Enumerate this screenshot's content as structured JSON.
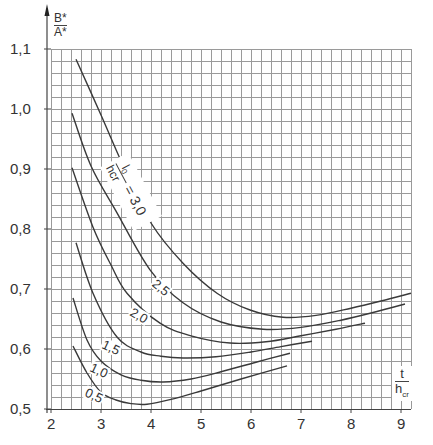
{
  "chart_data": {
    "type": "line",
    "title": "",
    "xlabel": "t / h_cr",
    "ylabel": "B* / A*",
    "xlabel_parts": {
      "numerator": "t",
      "denominator": "h",
      "denominator_sub": "cr"
    },
    "ylabel_parts": {
      "numerator": "B*",
      "denominator": "A*"
    },
    "xlim": [
      2,
      9.2
    ],
    "ylim": [
      0.5,
      1.1
    ],
    "grid": true,
    "grid_minor_x": 0.2,
    "grid_minor_y": 0.02,
    "x_ticks": [
      2,
      3,
      4,
      5,
      6,
      7,
      8,
      9
    ],
    "x_tick_labels": [
      "2",
      "3",
      "4",
      "5",
      "6",
      "7",
      "8",
      "9"
    ],
    "y_ticks": [
      0.5,
      0.6,
      0.7,
      0.8,
      0.9,
      1.0,
      1.1
    ],
    "y_tick_labels": [
      "0,5",
      "0,6",
      "0,7",
      "0,8",
      "0,9",
      "1,0",
      "1,1"
    ],
    "parameter_label": "l0 / hcr",
    "series": [
      {
        "name": "3,0",
        "label": "l0/hcr = 3,0",
        "x": [
          2.5,
          3.0,
          3.5,
          4.0,
          4.64,
          5.32,
          5.98,
          6.64,
          7.3,
          8.0,
          8.6,
          9.2
        ],
        "y": [
          1.083,
          0.99,
          0.895,
          0.81,
          0.743,
          0.693,
          0.665,
          0.653,
          0.656,
          0.668,
          0.68,
          0.693
        ]
      },
      {
        "name": "2,5",
        "label": "2,5",
        "x": [
          2.42,
          2.8,
          3.32,
          3.98,
          4.64,
          5.4,
          6.24,
          7.0,
          7.8,
          8.5,
          9.08
        ],
        "y": [
          0.993,
          0.905,
          0.827,
          0.732,
          0.677,
          0.645,
          0.633,
          0.636,
          0.648,
          0.662,
          0.675
        ]
      },
      {
        "name": "2,0",
        "label": "2,0",
        "x": [
          2.42,
          2.84,
          3.2,
          3.52,
          4.18,
          4.8,
          5.58,
          6.3,
          7.0,
          7.7,
          8.28
        ],
        "y": [
          0.902,
          0.803,
          0.74,
          0.693,
          0.643,
          0.622,
          0.61,
          0.612,
          0.622,
          0.633,
          0.643
        ]
      },
      {
        "name": "1,5",
        "label": "1,5",
        "x": [
          2.5,
          2.84,
          3.32,
          3.8,
          4.2,
          4.64,
          5.3,
          6.0,
          6.6,
          7.22
        ],
        "y": [
          0.777,
          0.693,
          0.62,
          0.595,
          0.588,
          0.585,
          0.587,
          0.595,
          0.604,
          0.613
        ]
      },
      {
        "name": "1,0",
        "label": "1,0",
        "x": [
          2.44,
          2.72,
          3.0,
          3.4,
          3.8,
          4.24,
          4.8,
          5.4,
          6.1,
          6.78
        ],
        "y": [
          0.685,
          0.615,
          0.58,
          0.557,
          0.548,
          0.545,
          0.55,
          0.562,
          0.578,
          0.593
        ]
      },
      {
        "name": "0,5",
        "label": "0,5",
        "x": [
          2.44,
          2.72,
          3.0,
          3.3,
          3.6,
          3.92,
          4.4,
          5.0,
          5.8,
          6.72
        ],
        "y": [
          0.605,
          0.56,
          0.528,
          0.515,
          0.509,
          0.508,
          0.516,
          0.53,
          0.55,
          0.572
        ]
      }
    ],
    "annotations": [
      {
        "text": "3,0",
        "series": "3,0",
        "x": 3.55,
        "y": 0.915
      },
      {
        "text": "2,5",
        "series": "2,5",
        "x": 4.2,
        "y": 0.7
      },
      {
        "text": "2,0",
        "series": "2,0",
        "x": 3.75,
        "y": 0.653
      },
      {
        "text": "1,5",
        "series": "1,5",
        "x": 3.2,
        "y": 0.6
      },
      {
        "text": "1,0",
        "series": "1,0",
        "x": 2.95,
        "y": 0.562
      },
      {
        "text": "0,5",
        "series": "0,5",
        "x": 2.85,
        "y": 0.52
      }
    ]
  },
  "labels": {
    "ylabel_num": "B*",
    "ylabel_den": "A*",
    "xlabel_num": "t",
    "xlabel_den": "h",
    "xlabel_den_sub": "cr",
    "param_num": "l",
    "param_num_sub": "0",
    "param_den": "hcr",
    "param_eq": "= 3,0",
    "curve_2_5": "2,5",
    "curve_2_0": "2,0",
    "curve_1_5": "1,5",
    "curve_1_0": "1,0",
    "curve_0_5": "0,5"
  },
  "colors": {
    "grid": "#9a9a9a",
    "curve": "#3a3a3a",
    "axis": "#444444"
  }
}
